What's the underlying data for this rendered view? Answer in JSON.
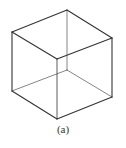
{
  "figure": {
    "caption": "(a)",
    "stroke_color": "#333333",
    "vertices": {
      "top_back": [
        67,
        10
      ],
      "top_left": [
        12,
        32
      ],
      "top_right": [
        112,
        38
      ],
      "top_front": [
        57,
        59
      ],
      "bottom_back": [
        67,
        70
      ],
      "bottom_left": [
        12,
        91
      ],
      "bottom_right": [
        112,
        97
      ],
      "bottom_front": [
        57,
        119
      ]
    }
  }
}
